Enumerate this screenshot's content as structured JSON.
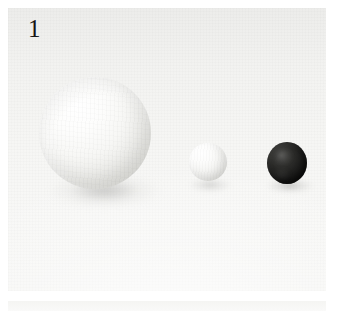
{
  "figure": {
    "panel_label": "1",
    "caption_alt": "Three spheres on a white background",
    "background_color": "#f6f6f4",
    "label_color": "#151515",
    "panel": {
      "x": 8,
      "y": 8,
      "width": 318,
      "height": 283
    }
  },
  "objects": [
    {
      "id": "sphere-large",
      "name": "large white sphere",
      "color": "#f2f2f0",
      "highlight_color": "#ffffff",
      "shade_color": "#cbcbc6",
      "center_x": 95,
      "center_y": 133,
      "radius": 56,
      "size_rank": 1
    },
    {
      "id": "sphere-medium",
      "name": "small white sphere",
      "color": "#f0f0ee",
      "highlight_color": "#ffffff",
      "shade_color": "#cfcfca",
      "center_x": 208,
      "center_y": 162,
      "radius": 19,
      "size_rank": 2
    },
    {
      "id": "sphere-dark",
      "name": "small black sphere",
      "color": "#1d1d1c",
      "highlight_color": "#6a6a68",
      "shade_color": "#0a0a09",
      "center_x": 287,
      "center_y": 163,
      "radius": 20,
      "size_rank": 3
    }
  ]
}
